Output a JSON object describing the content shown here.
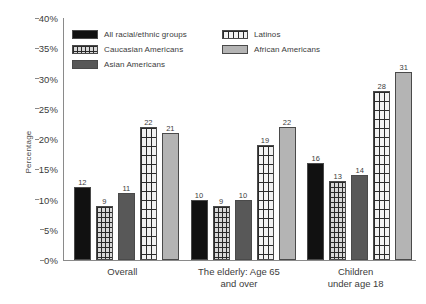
{
  "chart_data": {
    "type": "bar",
    "title": "",
    "xlabel": "",
    "ylabel": "Percentage",
    "ylim": [
      0,
      40
    ],
    "ytick_labels": [
      "0%",
      "5%",
      "10%",
      "15%",
      "20%",
      "25%",
      "30%",
      "35%",
      "40%"
    ],
    "ytick_values": [
      0,
      5,
      10,
      15,
      20,
      25,
      30,
      35,
      40
    ],
    "grid": false,
    "legend_position": "top-left-inside",
    "categories": [
      "Overall",
      "The elderly: Age 65\nand over",
      "Children\nunder age 18"
    ],
    "series": [
      {
        "name": "All racial/ethnic groups",
        "values": [
          12,
          10,
          16
        ],
        "color": "#111111",
        "fill": "solid"
      },
      {
        "name": "Caucasian Americans",
        "values": [
          9,
          9,
          13
        ],
        "color": "#d8d8d8",
        "fill": "grid-fine"
      },
      {
        "name": "Asian Americans",
        "values": [
          11,
          10,
          14
        ],
        "color": "#585858",
        "fill": "solid"
      },
      {
        "name": "Latinos",
        "values": [
          22,
          19,
          28
        ],
        "color": "#f2f2f2",
        "fill": "grid-coarse"
      },
      {
        "name": "African Americans",
        "values": [
          21,
          22,
          31
        ],
        "color": "#b4b4b4",
        "fill": "solid"
      }
    ]
  }
}
